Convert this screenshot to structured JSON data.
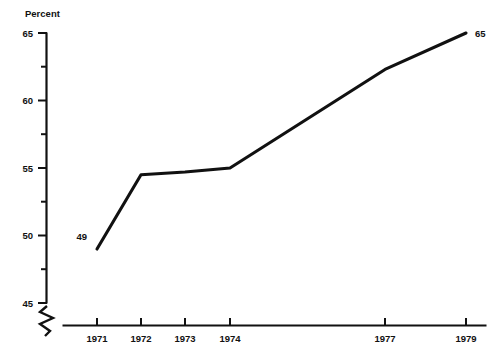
{
  "chart_data": {
    "type": "line",
    "title": "",
    "xlabel": "",
    "ylabel": "Percent",
    "ylim": [
      45,
      65
    ],
    "grid": false,
    "legend": "none",
    "x": [
      "1971",
      "1972",
      "1973",
      "1974",
      "1977",
      "1979"
    ],
    "categories": [
      "1971",
      "1972",
      "1973",
      "1974",
      "1977",
      "1979"
    ],
    "values": [
      49,
      54.5,
      54.7,
      55,
      62.3,
      65
    ],
    "series": [
      {
        "name": "Percent",
        "values": [
          49,
          54.5,
          54.7,
          55,
          62.3,
          65
        ]
      }
    ],
    "y_ticks": [
      45,
      50,
      55,
      60,
      65
    ],
    "y_tick_labels": [
      "45",
      "50",
      "55",
      "60",
      "65"
    ],
    "y_minor_ticks": [
      47.5,
      52.5,
      57.5,
      62.5
    ],
    "x_tick_labels": [
      "1971",
      "1972",
      "1973",
      "1974",
      "1977",
      "1979"
    ],
    "point_labels": [
      {
        "text": "49",
        "value": 49,
        "x": "1971",
        "position": "left"
      },
      {
        "text": "65",
        "value": 65,
        "x": "1979",
        "position": "right"
      }
    ],
    "axis_break": {
      "present": true,
      "axis": "y",
      "below_value": 45,
      "symbol": "zigzag"
    }
  },
  "axis": {
    "y_title": "Percent",
    "y_labels": [
      "65",
      "60",
      "55",
      "50",
      "45"
    ],
    "x_labels": [
      "1971",
      "1972",
      "1973",
      "1974",
      "1977",
      "1979"
    ]
  },
  "annotations": {
    "start_label": "49",
    "end_label": "65"
  },
  "colors": {
    "line": "#111111",
    "axis": "#111111",
    "text": "#111111",
    "background": "#ffffff"
  }
}
